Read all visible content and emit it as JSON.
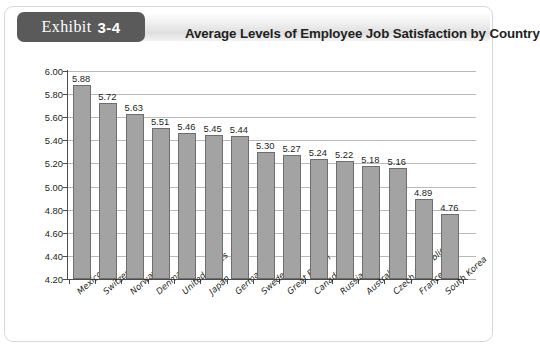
{
  "exhibit": {
    "badge_word": "Exhibit",
    "badge_number": "3-4",
    "title": "Average Levels of Employee Job Satisfaction by Country"
  },
  "colors": {
    "badge_background": "#5a5a5a",
    "bar_fill": "#a3a3a3",
    "bar_stroke": "#6e6e6e",
    "gridline": "#b9b9b9",
    "axis": "#4c4c4c",
    "text": "#231f20"
  },
  "chart_data": {
    "type": "bar",
    "title": "Average Levels of Employee Job Satisfaction by Country",
    "xlabel": "",
    "ylabel": "",
    "ylim": [
      4.2,
      6.0
    ],
    "ytick_step": 0.2,
    "grid": true,
    "legend": "none",
    "ytick_labels": [
      "6.00",
      "5.80",
      "5.60",
      "5.40",
      "5.20",
      "5.00",
      "4.80",
      "4.60",
      "4.40",
      "4.20"
    ],
    "categories": [
      "Mexico",
      "Switzerland",
      "Norway",
      "Denmark",
      "United States",
      "Japan",
      "Germany",
      "Sweden",
      "Great Britain",
      "Canada",
      "Russia",
      "Australia",
      "Czech Republic",
      "France",
      "South Korea"
    ],
    "values": [
      5.88,
      5.72,
      5.63,
      5.51,
      5.46,
      5.45,
      5.44,
      5.3,
      5.27,
      5.24,
      5.22,
      5.18,
      5.16,
      4.89,
      4.76
    ],
    "value_labels": [
      "5.88",
      "5.72",
      "5.63",
      "5.51",
      "5.46",
      "5.45",
      "5.44",
      "5.30",
      "5.27",
      "5.24",
      "5.22",
      "5.18",
      "5.16",
      "4.89",
      "4.76"
    ]
  }
}
